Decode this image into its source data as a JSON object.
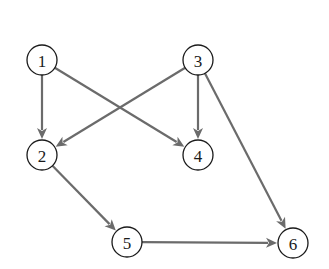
{
  "diagram": {
    "type": "directed-graph",
    "colors": {
      "edge": "#6b6b6b",
      "node_stroke": "#1a1a1a",
      "node_fill": "#ffffff",
      "background": "#ffffff"
    },
    "nodes": [
      {
        "id": "1",
        "label": "1",
        "x": 42,
        "y": 60
      },
      {
        "id": "2",
        "label": "2",
        "x": 42,
        "y": 155
      },
      {
        "id": "3",
        "label": "3",
        "x": 198,
        "y": 60
      },
      {
        "id": "4",
        "label": "4",
        "x": 198,
        "y": 155
      },
      {
        "id": "5",
        "label": "5",
        "x": 127,
        "y": 242
      },
      {
        "id": "6",
        "label": "6",
        "x": 293,
        "y": 243
      }
    ],
    "node_radius": 15,
    "edges": [
      {
        "from": "1",
        "to": "2"
      },
      {
        "from": "1",
        "to": "4"
      },
      {
        "from": "3",
        "to": "2"
      },
      {
        "from": "3",
        "to": "4"
      },
      {
        "from": "3",
        "to": "6"
      },
      {
        "from": "2",
        "to": "5"
      },
      {
        "from": "5",
        "to": "6"
      }
    ]
  }
}
